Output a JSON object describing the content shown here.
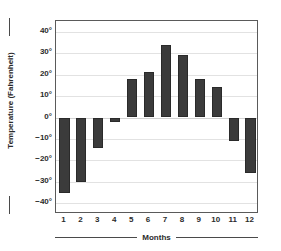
{
  "chart_data": {
    "type": "bar",
    "title": "",
    "xlabel": "Months",
    "ylabel": "Temperature (Fahrenheit)",
    "categories": [
      "1",
      "2",
      "3",
      "4",
      "5",
      "6",
      "7",
      "8",
      "9",
      "10",
      "11",
      "12"
    ],
    "values": [
      -35,
      -30,
      -14,
      -2,
      18,
      21,
      34,
      29,
      18,
      14,
      -11,
      -26
    ],
    "ylim": [
      -45,
      45
    ],
    "yticks": [
      40,
      30,
      20,
      10,
      0,
      -10,
      -20,
      -30,
      -40
    ],
    "ytick_labels": [
      "40°",
      "30°",
      "20°",
      "10°",
      "0°",
      "−10°",
      "−20°",
      "−30°",
      "−40°"
    ],
    "grid": true,
    "legend": false,
    "bar_color": "#3b3b3b",
    "grid_color": "#e2e2e2",
    "axis_color": "#5a5a5a"
  }
}
